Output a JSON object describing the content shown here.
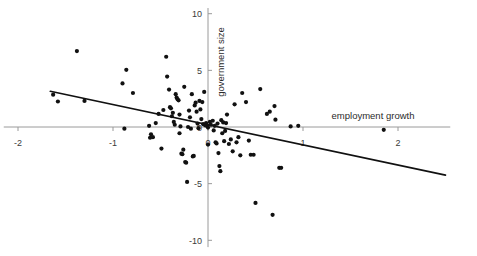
{
  "figure": {
    "kind": "scatter-plot",
    "background_color": "#ffffff",
    "point_color": "#111111",
    "axis_color": "#9a9a9a",
    "fit_line_color": "#111111"
  },
  "chart_data": {
    "type": "scatter",
    "title": "",
    "subtitle": "",
    "xlabel": "employment growth",
    "ylabel": "government size",
    "xlim": [
      -2.15,
      2.55
    ],
    "ylim": [
      -10.6,
      10.5
    ],
    "grid": false,
    "legend": null,
    "xticks": [
      -2,
      -1,
      0,
      1,
      2
    ],
    "xticklabels": [
      "-2",
      "-1",
      "0",
      "1",
      "2"
    ],
    "yticks": [
      10,
      5,
      0,
      -5,
      -10
    ],
    "yticklabels": [
      "10",
      "5",
      "0",
      "-5",
      "-10"
    ],
    "marker": "filled-circle",
    "marker_size": 2.1,
    "trend_line": {
      "kind": "linear-fit",
      "x_start": -1.66,
      "y_start": 3.15,
      "x_end": 2.5,
      "y_end": -4.25,
      "slope": -1.78,
      "intercept": 0.2
    },
    "points": [
      [
        -1.63,
        2.85
      ],
      [
        -1.58,
        2.25
      ],
      [
        -1.38,
        6.7
      ],
      [
        -1.3,
        2.3
      ],
      [
        -0.86,
        5.05
      ],
      [
        -0.9,
        3.85
      ],
      [
        -0.88,
        -0.15
      ],
      [
        -0.79,
        3.0
      ],
      [
        -0.62,
        0.1
      ],
      [
        -0.6,
        -0.65
      ],
      [
        -0.61,
        -0.95
      ],
      [
        -0.58,
        -0.9
      ],
      [
        -0.55,
        0.35
      ],
      [
        -0.52,
        1.15
      ],
      [
        -0.49,
        -1.9
      ],
      [
        -0.47,
        1.5
      ],
      [
        -0.44,
        6.2
      ],
      [
        -0.43,
        4.45
      ],
      [
        -0.41,
        3.3
      ],
      [
        -0.4,
        1.75
      ],
      [
        -0.39,
        1.65
      ],
      [
        -0.38,
        0.95
      ],
      [
        -0.37,
        1.25
      ],
      [
        -0.36,
        0.45
      ],
      [
        -0.35,
        0.2
      ],
      [
        -0.34,
        2.9
      ],
      [
        -0.33,
        2.6
      ],
      [
        -0.32,
        2.45
      ],
      [
        -0.31,
        2.35
      ],
      [
        -0.3,
        1.1
      ],
      [
        -0.3,
        -0.55
      ],
      [
        -0.29,
        0.05
      ],
      [
        -0.28,
        -2.35
      ],
      [
        -0.27,
        -2.4
      ],
      [
        -0.26,
        -2.0
      ],
      [
        -0.25,
        3.55
      ],
      [
        -0.24,
        -3.1
      ],
      [
        -0.23,
        -3.15
      ],
      [
        -0.22,
        -4.85
      ],
      [
        -0.21,
        0.0
      ],
      [
        -0.2,
        1.45
      ],
      [
        -0.19,
        0.85
      ],
      [
        -0.18,
        -0.15
      ],
      [
        -0.17,
        2.9
      ],
      [
        -0.16,
        -2.6
      ],
      [
        -0.15,
        -2.55
      ],
      [
        -0.14,
        1.9
      ],
      [
        -0.13,
        2.15
      ],
      [
        -0.12,
        1.35
      ],
      [
        -0.11,
        0.3
      ],
      [
        -0.1,
        -0.1
      ],
      [
        -0.09,
        2.3
      ],
      [
        -0.08,
        1.55
      ],
      [
        -0.07,
        0.7
      ],
      [
        -0.06,
        2.2
      ],
      [
        -0.05,
        0.25
      ],
      [
        -0.04,
        3.1
      ],
      [
        -0.03,
        0.15
      ],
      [
        -0.02,
        0.35
      ],
      [
        -0.01,
        0.1
      ],
      [
        0.0,
        -0.05
      ],
      [
        0.0,
        -1.55
      ],
      [
        0.02,
        0.45
      ],
      [
        0.03,
        0.2
      ],
      [
        0.05,
        0.55
      ],
      [
        0.06,
        -0.3
      ],
      [
        0.07,
        0.1
      ],
      [
        0.08,
        -1.35
      ],
      [
        0.09,
        -1.45
      ],
      [
        0.1,
        0.3
      ],
      [
        0.11,
        -2.3
      ],
      [
        0.12,
        -3.45
      ],
      [
        0.13,
        -3.9
      ],
      [
        0.14,
        0.6
      ],
      [
        0.15,
        -0.55
      ],
      [
        0.16,
        0.4
      ],
      [
        0.17,
        -1.25
      ],
      [
        0.18,
        -0.35
      ],
      [
        0.19,
        0.35
      ],
      [
        0.2,
        1.1
      ],
      [
        0.22,
        -1.5
      ],
      [
        0.24,
        -1.1
      ],
      [
        0.26,
        -2.15
      ],
      [
        0.28,
        2.0
      ],
      [
        0.3,
        -1.35
      ],
      [
        0.32,
        -0.9
      ],
      [
        0.34,
        -2.5
      ],
      [
        0.36,
        3.0
      ],
      [
        0.4,
        2.2
      ],
      [
        0.43,
        -1.2
      ],
      [
        0.45,
        -2.45
      ],
      [
        0.48,
        -2.45
      ],
      [
        0.5,
        -6.7
      ],
      [
        0.55,
        3.35
      ],
      [
        0.62,
        1.15
      ],
      [
        0.65,
        1.35
      ],
      [
        0.68,
        -7.75
      ],
      [
        0.7,
        1.85
      ],
      [
        0.71,
        0.65
      ],
      [
        0.75,
        -3.6
      ],
      [
        0.77,
        -3.6
      ],
      [
        0.87,
        0.05
      ],
      [
        0.95,
        0.1
      ],
      [
        1.85,
        -0.25
      ]
    ]
  }
}
